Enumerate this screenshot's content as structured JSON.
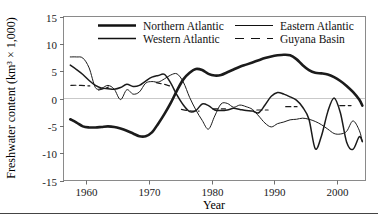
{
  "chart_data": {
    "type": "line",
    "title": "",
    "xlabel": "Year",
    "ylabel": "Freshwater content (km3 x 1,000)",
    "ylabel_display": "Freshwater content (km³ × 1,000)",
    "xlim": [
      1956.5,
      2004.5
    ],
    "ylim": [
      -15,
      15
    ],
    "xticks": [
      1960,
      1970,
      1980,
      1990,
      2000
    ],
    "xtick_labels": [
      "1960",
      "1970",
      "1980",
      "1990",
      "2000"
    ],
    "yticks": [
      15,
      10,
      5,
      0,
      -5,
      -10,
      -15
    ],
    "ytick_labels": [
      "15",
      "10",
      "5",
      "0",
      "-5",
      "-10",
      "-15"
    ],
    "grid": false,
    "zero_line": true,
    "legend_position": "top-center-inside",
    "series": [
      {
        "name": "Northern Atlantic",
        "style": "solid",
        "width": 2.6,
        "color": "#111111",
        "x": [
          1957.5,
          1958.5,
          1959.5,
          1960.5,
          1961.5,
          1962.5,
          1963.5,
          1964.5,
          1965.5,
          1966.5,
          1967.5,
          1968.5,
          1969.5,
          1970.5,
          1971.5,
          1972.5,
          1973.5,
          1974.5,
          1975.5,
          1976.5,
          1977.5,
          1978.5,
          1979.5,
          1980.5,
          1981.5,
          1982.5,
          1983.5,
          1984.5,
          1985.5,
          1986.5,
          1987.5,
          1988.5,
          1989.5,
          1990.5,
          1991.5,
          1992.5,
          1993.5,
          1994.5,
          1995.5,
          1996.5,
          1997.5,
          1998.5,
          1999.5,
          2000.5,
          2001.5,
          2002.5,
          2003.5,
          2004.0
        ],
        "y": [
          -3.8,
          -4.4,
          -5.1,
          -5.3,
          -5.3,
          -5.2,
          -5.1,
          -5.2,
          -5.5,
          -5.9,
          -6.4,
          -6.9,
          -6.9,
          -6.2,
          -4.6,
          -2.8,
          -0.8,
          1.5,
          3.5,
          4.7,
          5.4,
          5.2,
          4.5,
          4.2,
          4.3,
          4.8,
          5.3,
          5.8,
          6.2,
          6.6,
          7.0,
          7.4,
          7.7,
          7.9,
          8.0,
          7.9,
          7.2,
          6.1,
          5.2,
          4.7,
          4.6,
          4.4,
          3.9,
          3.2,
          2.3,
          1.2,
          -0.2,
          -1.3
        ]
      },
      {
        "name": "Western Atlantic",
        "style": "solid",
        "width": 1.5,
        "color": "#222222",
        "x": [
          1957.5,
          1958.5,
          1959.5,
          1960.5,
          1961.5,
          1962.5,
          1963.5,
          1964.5,
          1965.5,
          1966.5,
          1967.5,
          1968.5,
          1969.5,
          1970.5,
          1971.5,
          1972.5,
          1973.5,
          1974.5,
          1975.5,
          1976.5,
          1977.5,
          1978.5,
          1979.5,
          1980.5,
          1981.5,
          1982.5,
          1983.5,
          1984.5,
          1985.5,
          1986.5,
          1987.5,
          1988.5,
          1989.5,
          1990.5,
          1991.5,
          1992.5,
          1993.5,
          1994.5,
          1995.5,
          1996.5,
          1997.5,
          1998.5,
          1999.5,
          2000.5,
          2001.5,
          2002.5,
          2003.5,
          2004.0
        ],
        "y": [
          6.1,
          5.3,
          4.4,
          3.3,
          2.4,
          1.9,
          1.8,
          1.7,
          2.0,
          2.6,
          2.2,
          2.4,
          3.2,
          3.9,
          4.2,
          4.4,
          2.8,
          0.6,
          -1.2,
          -2.4,
          -2.2,
          -1.0,
          -1.3,
          -2.1,
          -2.2,
          -2.1,
          -1.8,
          -2.0,
          -2.2,
          -2.3,
          -2.6,
          -1.2,
          0.4,
          1.1,
          0.8,
          0.3,
          -0.3,
          -1.6,
          -3.8,
          -9.2,
          -6.8,
          -2.4,
          0.1,
          -2.6,
          -8.0,
          -9.3,
          -7.0,
          -7.9
        ]
      },
      {
        "name": "Eastern Atlantic",
        "style": "solid",
        "width": 1.0,
        "color": "#3a3a3a",
        "x": [
          1957.5,
          1958.5,
          1959.5,
          1960.5,
          1961.5,
          1962.5,
          1963.5,
          1964.5,
          1965.5,
          1966.5,
          1967.5,
          1968.5,
          1969.5,
          1970.5,
          1971.5,
          1972.5,
          1973.5,
          1974.5,
          1975.5,
          1976.5,
          1977.5,
          1978.5,
          1979.5,
          1980.5,
          1981.5,
          1982.5,
          1983.5,
          1984.5,
          1985.5,
          1986.5,
          1987.5,
          1988.5,
          1989.5,
          1990.5,
          1991.5,
          1992.5,
          1993.5,
          1994.5,
          1995.5,
          1996.5,
          1997.5,
          1998.5,
          1999.5,
          2000.5,
          2001.5,
          2002.5,
          2003.5,
          2004.0
        ],
        "y": [
          7.6,
          7.6,
          7.4,
          5.6,
          2.0,
          1.9,
          2.4,
          1.7,
          -0.2,
          1.6,
          0.8,
          1.2,
          2.8,
          3.1,
          3.0,
          3.6,
          4.3,
          4.5,
          3.0,
          0.2,
          -2.1,
          -4.0,
          -5.6,
          -3.2,
          -1.0,
          -0.9,
          -1.6,
          -1.2,
          -1.5,
          -2.0,
          -3.2,
          -4.5,
          -5.2,
          -4.6,
          -4.3,
          -3.9,
          -3.8,
          -3.6,
          -3.8,
          -4.2,
          -4.8,
          -5.6,
          -6.4,
          -6.5,
          -6.0,
          -4.1,
          -5.8,
          -7.9
        ]
      },
      {
        "name": "Guyana Basin",
        "style": "dashed",
        "width": 1.2,
        "color": "#2b2b2b",
        "segments": [
          {
            "x": [
              1957.6,
              1958.4,
              1959.2,
              1960.0,
              1960.6
            ],
            "y": [
              2.4,
              2.42,
              2.4,
              2.35,
              2.3
            ]
          },
          {
            "x": [
              1962.0,
              1962.8,
              1963.6
            ],
            "y": [
              1.55,
              1.8,
              2.1
            ]
          },
          {
            "x": [
              1971.2,
              1972.0,
              1972.8,
              1973.6
            ],
            "y": [
              2.9,
              2.7,
              2.5,
              2.2
            ]
          },
          {
            "x": [
              1975.2,
              1976.2,
              1977.2,
              1978.0
            ],
            "y": [
              -2.0,
              -2.2,
              -2.3,
              -2.3
            ]
          },
          {
            "x": [
              1980.2,
              1981.2,
              1982.2
            ],
            "y": [
              -1.9,
              -1.9,
              -1.9
            ]
          },
          {
            "x": [
              1987.2,
              1988.2,
              1989.0
            ],
            "y": [
              -2.1,
              -2.1,
              -2.1
            ]
          },
          {
            "x": [
              1991.8,
              1992.8,
              1993.6
            ],
            "y": [
              -1.5,
              -1.5,
              -1.5
            ]
          },
          {
            "x": [
              2000.4,
              2001.4,
              2002.2
            ],
            "y": [
              -1.3,
              -1.3,
              -1.3
            ]
          }
        ]
      }
    ],
    "legend": [
      {
        "label": "Northern Atlantic",
        "style": "solid",
        "width": 2.6,
        "column": 0,
        "row": 0
      },
      {
        "label": "Western Atlantic",
        "style": "solid",
        "width": 1.5,
        "column": 0,
        "row": 1
      },
      {
        "label": "Eastern Atlantic",
        "style": "solid",
        "width": 1.0,
        "column": 1,
        "row": 0
      },
      {
        "label": "Guyana Basin",
        "style": "dashed",
        "width": 1.2,
        "column": 1,
        "row": 1
      }
    ]
  },
  "axes": {
    "x_title": "Year",
    "y_title": "Freshwater content (km³ × 1,000)",
    "x_tick_labels": [
      "1960",
      "1970",
      "1980",
      "1990",
      "2000"
    ],
    "y_tick_labels": [
      "15",
      "10",
      "5",
      "0",
      "-5",
      "-10",
      "-15"
    ]
  },
  "legend_labels": {
    "northern_atlantic": "Northern Atlantic",
    "western_atlantic": "Western Atlantic",
    "eastern_atlantic": "Eastern Atlantic",
    "guyana_basin": "Guyana Basin"
  },
  "colors": {
    "series_ink": "#111111",
    "frame": "#8a8a8a",
    "zero_line": "#c9c9c9",
    "background": "#ffffff"
  }
}
